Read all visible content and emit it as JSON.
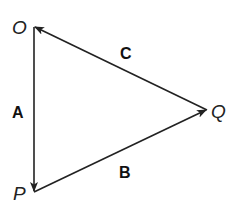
{
  "diagram": {
    "type": "vector-triangle",
    "points": {
      "O": {
        "label": "O",
        "x": 34,
        "y": 27
      },
      "P": {
        "label": "P",
        "x": 34,
        "y": 192
      },
      "Q": {
        "label": "Q",
        "x": 207,
        "y": 110
      }
    },
    "vectors": [
      {
        "name": "A",
        "label": "A",
        "from": "O",
        "to": "P"
      },
      {
        "name": "B",
        "label": "B",
        "from": "P",
        "to": "Q"
      },
      {
        "name": "C",
        "label": "C",
        "from": "Q",
        "to": "O"
      }
    ],
    "line_color": "#222222"
  }
}
